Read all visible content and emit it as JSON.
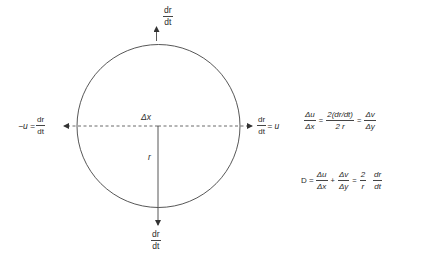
{
  "diagram": {
    "circle": {
      "cx": 158.5,
      "cy": 126,
      "r": 81.5,
      "stroke": "#444444"
    },
    "labels": {
      "top_arrow": {
        "num": "dr",
        "den": "dt"
      },
      "bottom_arrow": {
        "num": "dr",
        "den": "dt"
      },
      "left_arrow": {
        "prefix": "−u =",
        "num": "dr",
        "den": "dt"
      },
      "right_arrow": {
        "num": "dr",
        "den": "dt",
        "suffix": "= u"
      },
      "center": "Δx",
      "radius": "r"
    },
    "equations": {
      "eq1": {
        "lhs": {
          "num": "Δu",
          "den": "Δx"
        },
        "eq1": "=",
        "mid": {
          "num": "2(dr/dt)",
          "den": "2 r"
        },
        "eq2": "=",
        "rhs": {
          "num": "Δv",
          "den": "Δy"
        }
      },
      "eq2": {
        "lead": "D =",
        "t1": {
          "num": "Δu",
          "den": "Δx"
        },
        "plus": "+",
        "t2": {
          "num": "Δv",
          "den": "Δy"
        },
        "eq": "=",
        "t3": {
          "num": "2",
          "den": "r"
        },
        "t4": {
          "num": "dr",
          "den": "dt"
        }
      }
    }
  }
}
